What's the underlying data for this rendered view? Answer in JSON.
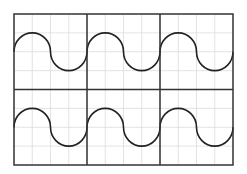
{
  "diagram": {
    "title": "",
    "grid": {
      "rows": 2,
      "cols": 3,
      "subdivisions": 4
    },
    "panels": [
      {
        "row": 0,
        "col": 0,
        "shape": "s-curve"
      },
      {
        "row": 0,
        "col": 1,
        "shape": "s-curve"
      },
      {
        "row": 0,
        "col": 2,
        "shape": "s-curve"
      },
      {
        "row": 1,
        "col": 0,
        "shape": "s-curve"
      },
      {
        "row": 1,
        "col": 1,
        "shape": "s-curve"
      },
      {
        "row": 1,
        "col": 2,
        "shape": "s-curve"
      }
    ],
    "colors": {
      "grid": "#dcdcdc",
      "frame": "#333333",
      "curve": "#222222",
      "background": "#ffffff"
    }
  }
}
